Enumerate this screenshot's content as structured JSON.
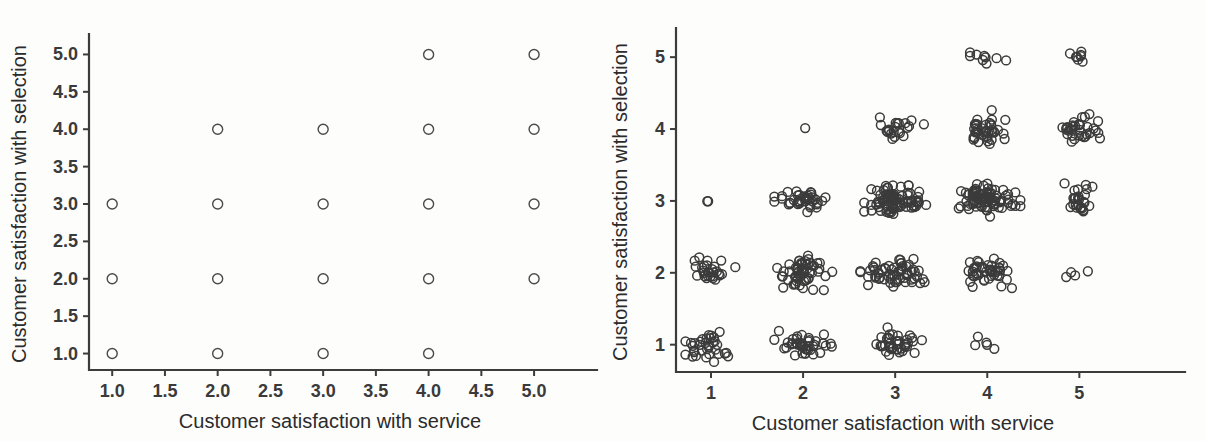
{
  "figure": {
    "background_color": "#fdfdfc",
    "marker_color": "#4a4a4a",
    "axis_color": "#3c3c3c",
    "panel_count": 2
  },
  "chart_data": [
    {
      "type": "scatter",
      "panel": "left",
      "title": "",
      "subtitle": "",
      "xlabel": "Customer satisfaction with service",
      "ylabel": "Customer satisfaction with selection",
      "xlim": [
        0.78,
        5.35
      ],
      "ylim": [
        0.78,
        5.22
      ],
      "xticks": [
        1.0,
        1.5,
        2.0,
        2.5,
        3.0,
        3.5,
        4.0,
        4.5,
        5.0
      ],
      "xtick_labels": [
        "1.0",
        "1.5",
        "2.0",
        "2.5",
        "3.0",
        "3.5",
        "4.0",
        "4.5",
        "5.0"
      ],
      "yticks": [
        1.0,
        1.5,
        2.0,
        2.5,
        3.0,
        3.5,
        4.0,
        4.5,
        5.0
      ],
      "ytick_labels": [
        "1.0",
        "1.5",
        "2.0",
        "2.5",
        "3.0",
        "3.5",
        "4.0",
        "4.5",
        "5.0"
      ],
      "grid": false,
      "legend": null,
      "marker_style": "open-circle",
      "note": "Unjittered discrete ratings; overplotting hides sample sizes",
      "points": [
        {
          "x": 1,
          "y": 1
        },
        {
          "x": 1,
          "y": 2
        },
        {
          "x": 1,
          "y": 3
        },
        {
          "x": 2,
          "y": 1
        },
        {
          "x": 2,
          "y": 2
        },
        {
          "x": 2,
          "y": 3
        },
        {
          "x": 2,
          "y": 4
        },
        {
          "x": 3,
          "y": 1
        },
        {
          "x": 3,
          "y": 2
        },
        {
          "x": 3,
          "y": 3
        },
        {
          "x": 3,
          "y": 4
        },
        {
          "x": 4,
          "y": 1
        },
        {
          "x": 4,
          "y": 2
        },
        {
          "x": 4,
          "y": 3
        },
        {
          "x": 4,
          "y": 4
        },
        {
          "x": 4,
          "y": 5
        },
        {
          "x": 5,
          "y": 2
        },
        {
          "x": 5,
          "y": 3
        },
        {
          "x": 5,
          "y": 4
        },
        {
          "x": 5,
          "y": 5
        }
      ]
    },
    {
      "type": "scatter",
      "panel": "right",
      "title": "",
      "subtitle": "",
      "xlabel": "Customer satisfaction with service",
      "ylabel": "Customer satisfaction with selection",
      "xlim": [
        0.62,
        5.55
      ],
      "ylim": [
        0.62,
        5.35
      ],
      "xticks": [
        1,
        2,
        3,
        4,
        5
      ],
      "xtick_labels": [
        "1",
        "2",
        "3",
        "4",
        "5"
      ],
      "yticks": [
        1,
        2,
        3,
        4,
        5
      ],
      "ytick_labels": [
        "1",
        "2",
        "3",
        "4",
        "5"
      ],
      "grid": false,
      "legend": null,
      "marker_style": "open-circle",
      "note": "Same data with jitter added; cluster density reveals counts",
      "clusters": [
        {
          "x": 1,
          "y": 1,
          "count": 34,
          "jx": 0.16,
          "jy": 0.1
        },
        {
          "x": 1,
          "y": 2,
          "count": 28,
          "jx": 0.11,
          "jy": 0.09
        },
        {
          "x": 1,
          "y": 3,
          "count": 2,
          "jx": 0.06,
          "jy": 0.05
        },
        {
          "x": 2,
          "y": 1,
          "count": 42,
          "jx": 0.13,
          "jy": 0.08
        },
        {
          "x": 2,
          "y": 2,
          "count": 58,
          "jx": 0.14,
          "jy": 0.1
        },
        {
          "x": 2,
          "y": 3,
          "count": 40,
          "jx": 0.13,
          "jy": 0.09
        },
        {
          "x": 2,
          "y": 4,
          "count": 1,
          "jx": 0.03,
          "jy": 0.03
        },
        {
          "x": 3,
          "y": 1,
          "count": 40,
          "jx": 0.13,
          "jy": 0.1
        },
        {
          "x": 3,
          "y": 2,
          "count": 62,
          "jx": 0.16,
          "jy": 0.08
        },
        {
          "x": 3,
          "y": 3,
          "count": 88,
          "jx": 0.14,
          "jy": 0.09
        },
        {
          "x": 3,
          "y": 4,
          "count": 22,
          "jx": 0.13,
          "jy": 0.08
        },
        {
          "x": 4,
          "y": 1,
          "count": 5,
          "jx": 0.1,
          "jy": 0.07
        },
        {
          "x": 4,
          "y": 2,
          "count": 46,
          "jx": 0.13,
          "jy": 0.09
        },
        {
          "x": 4,
          "y": 3,
          "count": 86,
          "jx": 0.15,
          "jy": 0.1
        },
        {
          "x": 4,
          "y": 4,
          "count": 40,
          "jx": 0.13,
          "jy": 0.11
        },
        {
          "x": 4,
          "y": 5,
          "count": 9,
          "jx": 0.11,
          "jy": 0.04
        },
        {
          "x": 5,
          "y": 2,
          "count": 4,
          "jx": 0.08,
          "jy": 0.07
        },
        {
          "x": 5,
          "y": 3,
          "count": 26,
          "jx": 0.1,
          "jy": 0.12
        },
        {
          "x": 5,
          "y": 4,
          "count": 34,
          "jx": 0.13,
          "jy": 0.09
        },
        {
          "x": 5,
          "y": 5,
          "count": 8,
          "jx": 0.09,
          "jy": 0.05
        }
      ]
    }
  ]
}
